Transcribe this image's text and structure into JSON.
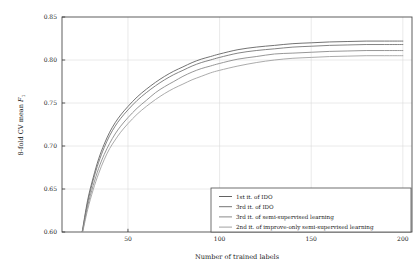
{
  "chart_data": {
    "type": "line",
    "title": "",
    "xlabel": "Number of trained labels",
    "ylabel": "8-fold CV mean F1",
    "ylabel_main": "8-fold CV mean ",
    "ylabel_sym": "F",
    "ylabel_sub": "1",
    "xlim": [
      14,
      205
    ],
    "ylim": [
      0.6,
      0.85
    ],
    "xticks": [
      50,
      100,
      150,
      200
    ],
    "xtick_labels": [
      "50",
      "100",
      "150",
      "200"
    ],
    "yticks": [
      0.6,
      0.65,
      0.7,
      0.75,
      0.8,
      0.85
    ],
    "ytick_labels": [
      "0.60",
      "0.65",
      "0.70",
      "0.75",
      "0.80",
      "0.85"
    ],
    "grid": true,
    "grid_color": "#d9d9d9",
    "legend_position": "lower right",
    "x": [
      25,
      28,
      31,
      34,
      37,
      40,
      43,
      46,
      50,
      55,
      60,
      65,
      70,
      75,
      80,
      85,
      90,
      95,
      100,
      110,
      120,
      130,
      140,
      150,
      160,
      170,
      180,
      190,
      200
    ],
    "series": [
      {
        "name": "1st it. of IDO",
        "color": "#5a5a5a",
        "values": [
          0.6,
          0.637,
          0.663,
          0.685,
          0.702,
          0.716,
          0.727,
          0.736,
          0.746,
          0.757,
          0.766,
          0.774,
          0.781,
          0.787,
          0.792,
          0.797,
          0.801,
          0.804,
          0.807,
          0.812,
          0.815,
          0.817,
          0.819,
          0.82,
          0.821,
          0.8215,
          0.822,
          0.822,
          0.822
        ]
      },
      {
        "name": "3rd it. of IDO",
        "color": "#6e6e6e",
        "values": [
          0.599,
          0.634,
          0.66,
          0.681,
          0.698,
          0.712,
          0.723,
          0.732,
          0.742,
          0.753,
          0.762,
          0.77,
          0.777,
          0.783,
          0.788,
          0.793,
          0.797,
          0.8,
          0.803,
          0.808,
          0.811,
          0.813,
          0.815,
          0.816,
          0.817,
          0.8175,
          0.818,
          0.818,
          0.818
        ]
      },
      {
        "name": "3rd it. of semi-supervised learning",
        "color": "#848484",
        "values": [
          0.598,
          0.63,
          0.654,
          0.674,
          0.69,
          0.703,
          0.714,
          0.723,
          0.733,
          0.744,
          0.753,
          0.762,
          0.769,
          0.775,
          0.781,
          0.786,
          0.79,
          0.793,
          0.796,
          0.801,
          0.804,
          0.807,
          0.808,
          0.809,
          0.81,
          0.8105,
          0.811,
          0.811,
          0.811
        ]
      },
      {
        "name": "2nd it. of improve-only semi-supervised learning",
        "color": "#9c9c9c",
        "values": [
          0.597,
          0.626,
          0.649,
          0.668,
          0.684,
          0.697,
          0.707,
          0.716,
          0.726,
          0.737,
          0.746,
          0.754,
          0.761,
          0.767,
          0.772,
          0.777,
          0.781,
          0.785,
          0.788,
          0.793,
          0.797,
          0.8,
          0.802,
          0.803,
          0.804,
          0.8045,
          0.805,
          0.805,
          0.805
        ]
      }
    ],
    "legend": [
      {
        "label": "1st it. of IDO",
        "color": "#5a5a5a"
      },
      {
        "label": "3rd it. of IDO",
        "color": "#6e6e6e"
      },
      {
        "label": "3rd it. of semi-supervised learning",
        "color": "#848484"
      },
      {
        "label": "2nd it. of improve-only semi-supervised learning",
        "color": "#9c9c9c"
      }
    ]
  }
}
